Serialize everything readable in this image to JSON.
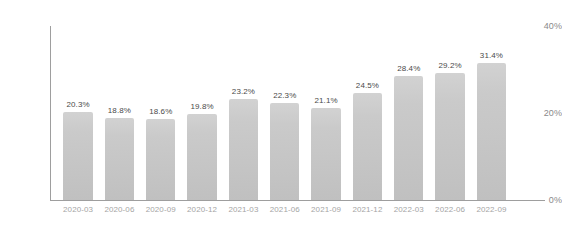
{
  "chart_data": {
    "type": "bar",
    "title": "",
    "subtitle": "",
    "xlabel": "",
    "ylabel": "",
    "categories": [
      "2020-03",
      "2020-06",
      "2020-09",
      "2020-12",
      "2021-03",
      "2021-06",
      "2021-09",
      "2021-12",
      "2022-03",
      "2022-06",
      "2022-09"
    ],
    "values": [
      20.3,
      18.8,
      18.6,
      19.8,
      23.2,
      22.3,
      21.1,
      24.5,
      28.4,
      29.2,
      31.4
    ],
    "data_labels": [
      "20.3%",
      "18.8%",
      "18.6%",
      "19.8%",
      "23.2%",
      "22.3%",
      "21.1%",
      "24.5%",
      "28.4%",
      "29.2%",
      "31.4%"
    ],
    "ylim": [
      0,
      40
    ],
    "y_ticks": [
      0,
      20,
      40
    ],
    "y_tick_labels": [
      "0%",
      "20%",
      "40%"
    ],
    "grid": false,
    "legend": false,
    "legend_position": "none",
    "bar_color": "#c8c8c8",
    "data_label_color": "#4a4a4a",
    "tick_label_color": "#a5a5a5",
    "axis_color": "#9e9e9e",
    "background_color": "#ffffff"
  }
}
